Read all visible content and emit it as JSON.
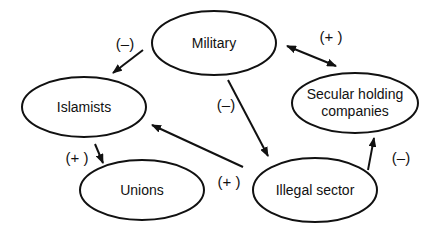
{
  "diagram": {
    "type": "causal-relationship-diagram",
    "nodes": [
      {
        "id": "military",
        "label": "Military",
        "lines": [
          "Military"
        ],
        "cx": 214,
        "cy": 43,
        "rx": 62,
        "ry": 32
      },
      {
        "id": "islamists",
        "label": "Islamists",
        "lines": [
          "Islamists"
        ],
        "cx": 84,
        "cy": 107,
        "rx": 62,
        "ry": 30
      },
      {
        "id": "secular",
        "label": "Secular holding companies",
        "lines": [
          "Secular holding",
          "companies"
        ],
        "cx": 355,
        "cy": 103,
        "rx": 63,
        "ry": 30
      },
      {
        "id": "unions",
        "label": "Unions",
        "lines": [
          "Unions"
        ],
        "cx": 142,
        "cy": 190,
        "rx": 62,
        "ry": 30
      },
      {
        "id": "illegal",
        "label": "Illegal sector",
        "lines": [
          "Illegal sector"
        ],
        "cx": 315,
        "cy": 190,
        "rx": 62,
        "ry": 32
      }
    ],
    "edges": [
      {
        "from": "military",
        "to": "islamists",
        "sign": "(–)",
        "bidirectional": false
      },
      {
        "from": "military",
        "to": "secular",
        "sign": "(+ )",
        "bidirectional": true
      },
      {
        "from": "military",
        "to": "illegal",
        "sign": "(–)",
        "bidirectional": false
      },
      {
        "from": "illegal",
        "to": "islamists",
        "sign": "(+ )",
        "bidirectional": false
      },
      {
        "from": "islamists",
        "to": "unions",
        "sign": "(+ )",
        "bidirectional": false
      },
      {
        "from": "illegal",
        "to": "secular",
        "sign": "(–)",
        "bidirectional": false
      }
    ],
    "colors": {
      "stroke": "#111111",
      "background": "#ffffff"
    }
  },
  "labels": {
    "military": "Military",
    "islamists": "Islamists",
    "secular_line1": "Secular holding",
    "secular_line2": "companies",
    "unions": "Unions",
    "illegal": "Illegal sector",
    "edge_military_islamists": "(–)",
    "edge_military_secular": "(+ )",
    "edge_military_illegal": "(–)",
    "edge_illegal_islamists": "(+ )",
    "edge_islamists_unions": "(+ )",
    "edge_illegal_secular": "(–)"
  }
}
